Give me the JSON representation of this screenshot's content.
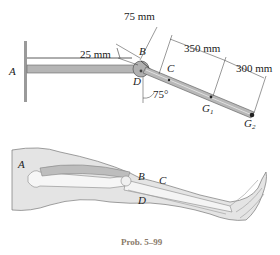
{
  "diagram": {
    "top": {
      "labels": {
        "A": "A",
        "B": "B",
        "C": "C",
        "D": "D",
        "G1_main": "G",
        "G1_sub": "1",
        "G2_main": "G",
        "G2_sub": "2"
      },
      "dimensions": {
        "d_25": "25 mm",
        "d_75": "75 mm",
        "d_350": "350 mm",
        "d_300": "300 mm",
        "angle": "75°"
      }
    },
    "bottom": {
      "labels": {
        "A": "A",
        "B": "B",
        "C": "C",
        "D": "D"
      }
    },
    "caption": "Prob. 5–99"
  }
}
